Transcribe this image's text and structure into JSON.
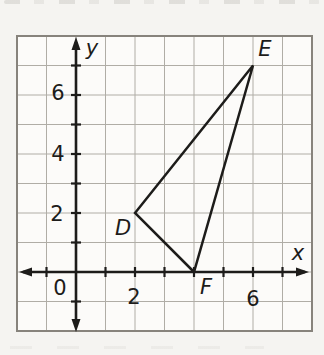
{
  "figure": {
    "kind": "coordinate-plane geometry diagram (scanned textbook)",
    "background": "#f5f4f1",
    "plot_background": "#fcfbf9",
    "border_color": "#87837c",
    "grid_color": "#b0ada6",
    "axis_color": "#1d1c1a",
    "shape_color": "#1d1c1a"
  },
  "chart_data": {
    "type": "scatter",
    "subtype": "triangle-on-coordinate-plane",
    "title": "",
    "xlabel": "x",
    "ylabel": "y",
    "xlim": [
      -2,
      8
    ],
    "ylim": [
      -2,
      8
    ],
    "grid": true,
    "origin_label": "0",
    "x_ticks_labeled": [
      2,
      6
    ],
    "y_ticks_labeled": [
      6,
      4,
      2
    ],
    "tick_step": 1,
    "points": [
      {
        "label": "D",
        "x": 2,
        "y": 2
      },
      {
        "label": "E",
        "x": 6,
        "y": 7
      },
      {
        "label": "F",
        "x": 4,
        "y": 0
      }
    ],
    "segments": [
      [
        "D",
        "E"
      ],
      [
        "E",
        "F"
      ],
      [
        "F",
        "D"
      ]
    ]
  }
}
